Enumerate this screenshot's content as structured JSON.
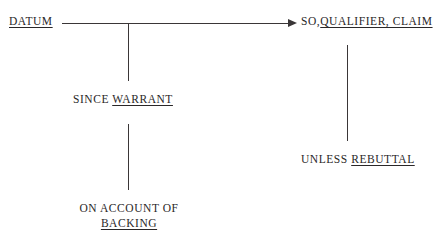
{
  "diagram": {
    "background_color": "#ffffff",
    "line_color": "#3a3637",
    "text_color": "#2a2728",
    "nodes": {
      "datum": {
        "label": "DATUM",
        "underlined_part": "DATUM",
        "plain_prefix": ""
      },
      "claim": {
        "plain_prefix": "SO,",
        "underlined_part": "QUALIFIER,  CLAIM",
        "label": "SO,QUALIFIER,  CLAIM"
      },
      "warrant": {
        "plain_prefix": "SINCE ",
        "underlined_part": "WARRANT",
        "label": "SINCE WARRANT"
      },
      "rebuttal": {
        "plain_prefix": "UNLESS ",
        "underlined_part": "REBUTTAL",
        "label": "UNLESS REBUTTAL"
      },
      "backing": {
        "line1": "ON ACCOUNT OF",
        "underlined_part": "BACKING",
        "label": "ON ACCOUNT OF BACKING"
      }
    },
    "connectors": [
      {
        "name": "datum-to-claim-arrow",
        "type": "horizontal-arrow"
      },
      {
        "name": "claim-to-rebuttal",
        "type": "vertical-line"
      },
      {
        "name": "datum-to-warrant",
        "type": "vertical-line"
      },
      {
        "name": "warrant-to-backing",
        "type": "vertical-line"
      }
    ]
  }
}
